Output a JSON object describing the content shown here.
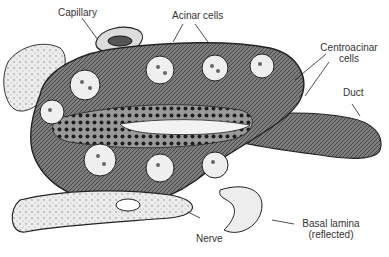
{
  "diagram": {
    "labels": {
      "capillary": "Capillary",
      "acinar_cells": "Acinar cells",
      "centroacinar_line1": "Centroacinar",
      "centroacinar_line2": "cells",
      "duct": "Duct",
      "basal_lamina_line1": "Basal lamina",
      "basal_lamina_line2": "(reflected)",
      "nerve": "Nerve"
    },
    "colors": {
      "ink": "#222222",
      "cell_fill": "#8a8a8a",
      "light_fill": "#e6e6e6",
      "background": "#ffffff"
    }
  }
}
